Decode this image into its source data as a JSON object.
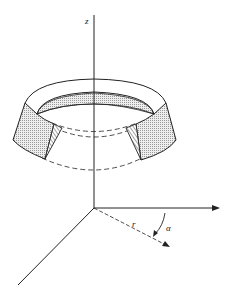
{
  "figure": {
    "labels": {
      "z_axis": "z",
      "radial": "r",
      "angle": "α"
    },
    "colors": {
      "line": "#222222",
      "fill_light": "#e6e6e6",
      "fill_inner": "#d6d6d6",
      "background": "#ffffff"
    }
  }
}
